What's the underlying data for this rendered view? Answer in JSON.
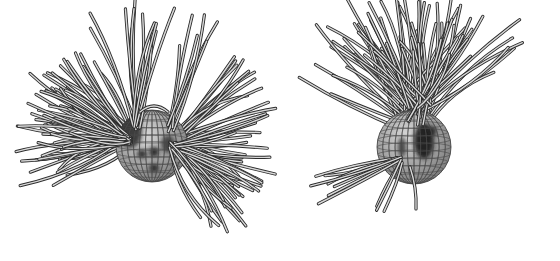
{
  "figure": {
    "panels": [
      {
        "id": "left",
        "subject": "star sphere with latitude/longitude grid, several dark spots, field-line bundles fanning out to the left and right",
        "spots": 5,
        "field_line_bundles": [
          "left-fan",
          "right-fan",
          "top-loop"
        ],
        "field_line_count": 90
      },
      {
        "id": "right",
        "subject": "star sphere with grid, large dark polar spot, field lines fanning upward and a small bundle to the lower left",
        "spots": 2,
        "field_line_bundles": [
          "upper-fan",
          "lower-left-fan"
        ],
        "field_line_count": 75
      }
    ],
    "colors": {
      "background": "#ffffff",
      "sphere_light": "#d9d9d9",
      "sphere_dark": "#7a7a7a",
      "spot": "#1e1e1e",
      "tube_edge": "#2a2a2a",
      "tube_core": "#d8d8d8"
    }
  }
}
